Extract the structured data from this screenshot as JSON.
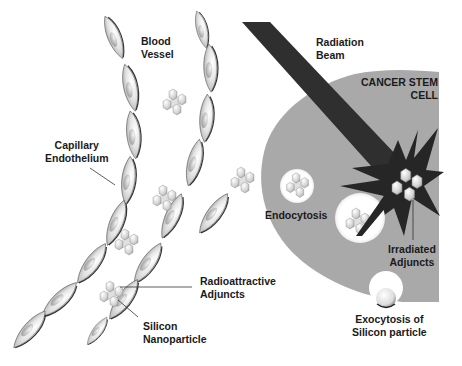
{
  "diagram": {
    "type": "biological schematic",
    "labels": {
      "blood_vessel": [
        "Blood",
        "Vessel"
      ],
      "capillary_endothelium": [
        "Capillary",
        "Endothelium"
      ],
      "radiation_beam": [
        "Radiation",
        "Beam"
      ],
      "cancer_stem_cell": [
        "CANCER STEM",
        "CELL"
      ],
      "endocytosis": "Endocytosis",
      "irradiated_adjuncts": [
        "Irradiated",
        "Adjuncts"
      ],
      "radioattractive_adjuncts": [
        "Radioattractive",
        "Adjuncts"
      ],
      "silicon_nanoparticle": [
        "Silicon",
        "Nanoparticle"
      ],
      "exocytosis": [
        "Exocytosis of",
        "Silicon particle"
      ]
    },
    "colors": {
      "cell_body": "#a8a8a8",
      "radiation_beam": "#2e2e2e",
      "burst": "#2a2a2a",
      "endothelial_cell": "#d6d6d6",
      "nanoparticle": "#cfcfcf",
      "text": "#1a1a1a"
    }
  }
}
